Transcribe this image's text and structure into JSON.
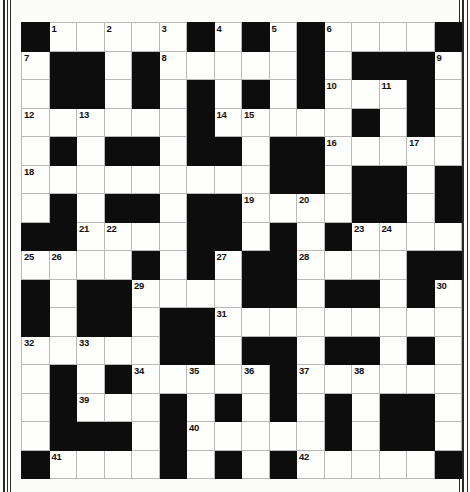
{
  "puzzle": {
    "kind": "crossword-grid",
    "rows": 16,
    "cols": 16,
    "colors": {
      "block": "#0d0d0d",
      "cell": "#fefefd",
      "grid_line": "#b9b9b9",
      "page": "#fbfbf9",
      "number": "#111111",
      "edge_rule": "#2a2a2a"
    },
    "numbers_present": [
      "1",
      "2",
      "3",
      "4",
      "5",
      "6",
      "7",
      "8",
      "9",
      "10",
      "11",
      "12",
      "13",
      "14",
      "15",
      "16",
      "17",
      "18",
      "19",
      "20",
      "21",
      "22",
      "23",
      "24",
      "25",
      "26",
      "27",
      "28",
      "29",
      "30",
      "31",
      "32",
      "33",
      "34",
      "35",
      "36",
      "37",
      "38",
      "39",
      "40",
      "41",
      "42"
    ],
    "cells": [
      [
        {
          "b": true
        },
        {
          "b": false,
          "n": "1"
        },
        {
          "b": false
        },
        {
          "b": false,
          "n": "2"
        },
        {
          "b": false
        },
        {
          "b": false,
          "n": "3"
        },
        {
          "b": true
        },
        {
          "b": false,
          "n": "4"
        },
        {
          "b": true
        },
        {
          "b": false,
          "n": "5"
        },
        {
          "b": true
        },
        {
          "b": false,
          "n": "6"
        },
        {
          "b": false
        },
        {
          "b": false
        },
        {
          "b": false
        },
        {
          "b": true
        }
      ],
      [
        {
          "b": false,
          "n": "7"
        },
        {
          "b": true
        },
        {
          "b": true
        },
        {
          "b": false
        },
        {
          "b": true
        },
        {
          "b": false,
          "n": "8"
        },
        {
          "b": false
        },
        {
          "b": false
        },
        {
          "b": false
        },
        {
          "b": false
        },
        {
          "b": true
        },
        {
          "b": false
        },
        {
          "b": true
        },
        {
          "b": true
        },
        {
          "b": true
        },
        {
          "b": false,
          "n": "9"
        }
      ],
      [
        {
          "b": false
        },
        {
          "b": true
        },
        {
          "b": true
        },
        {
          "b": false
        },
        {
          "b": true
        },
        {
          "b": false
        },
        {
          "b": true
        },
        {
          "b": false
        },
        {
          "b": true
        },
        {
          "b": false
        },
        {
          "b": true
        },
        {
          "b": false,
          "n": "10"
        },
        {
          "b": false
        },
        {
          "b": false,
          "n": "11"
        },
        {
          "b": true
        },
        {
          "b": false
        }
      ],
      [
        {
          "b": false,
          "n": "12"
        },
        {
          "b": false
        },
        {
          "b": false,
          "n": "13"
        },
        {
          "b": false
        },
        {
          "b": false
        },
        {
          "b": false
        },
        {
          "b": true
        },
        {
          "b": false,
          "n": "14"
        },
        {
          "b": false,
          "n": "15"
        },
        {
          "b": false
        },
        {
          "b": false
        },
        {
          "b": false
        },
        {
          "b": true
        },
        {
          "b": false
        },
        {
          "b": true
        },
        {
          "b": false
        }
      ],
      [
        {
          "b": false
        },
        {
          "b": true
        },
        {
          "b": false
        },
        {
          "b": true
        },
        {
          "b": true
        },
        {
          "b": false
        },
        {
          "b": true
        },
        {
          "b": true
        },
        {
          "b": false
        },
        {
          "b": true
        },
        {
          "b": true
        },
        {
          "b": false,
          "n": "16"
        },
        {
          "b": false
        },
        {
          "b": false
        },
        {
          "b": false,
          "n": "17"
        },
        {
          "b": false
        }
      ],
      [
        {
          "b": false,
          "n": "18"
        },
        {
          "b": false
        },
        {
          "b": false
        },
        {
          "b": false
        },
        {
          "b": false
        },
        {
          "b": false
        },
        {
          "b": false
        },
        {
          "b": false
        },
        {
          "b": false
        },
        {
          "b": true
        },
        {
          "b": true
        },
        {
          "b": false
        },
        {
          "b": true
        },
        {
          "b": true
        },
        {
          "b": false
        },
        {
          "b": true
        }
      ],
      [
        {
          "b": false
        },
        {
          "b": true
        },
        {
          "b": false
        },
        {
          "b": true
        },
        {
          "b": true
        },
        {
          "b": false
        },
        {
          "b": true
        },
        {
          "b": true
        },
        {
          "b": false,
          "n": "19"
        },
        {
          "b": false
        },
        {
          "b": false,
          "n": "20"
        },
        {
          "b": false
        },
        {
          "b": true
        },
        {
          "b": true
        },
        {
          "b": false
        },
        {
          "b": true
        }
      ],
      [
        {
          "b": true
        },
        {
          "b": true
        },
        {
          "b": false,
          "n": "21"
        },
        {
          "b": false,
          "n": "22"
        },
        {
          "b": false
        },
        {
          "b": false
        },
        {
          "b": true
        },
        {
          "b": true
        },
        {
          "b": false
        },
        {
          "b": true
        },
        {
          "b": false
        },
        {
          "b": true
        },
        {
          "b": false,
          "n": "23"
        },
        {
          "b": false,
          "n": "24"
        },
        {
          "b": false
        },
        {
          "b": false
        }
      ],
      [
        {
          "b": false,
          "n": "25"
        },
        {
          "b": false,
          "n": "26"
        },
        {
          "b": false
        },
        {
          "b": false
        },
        {
          "b": true
        },
        {
          "b": false
        },
        {
          "b": true
        },
        {
          "b": false,
          "n": "27"
        },
        {
          "b": true
        },
        {
          "b": true
        },
        {
          "b": false,
          "n": "28"
        },
        {
          "b": false
        },
        {
          "b": false
        },
        {
          "b": false
        },
        {
          "b": true
        },
        {
          "b": true
        }
      ],
      [
        {
          "b": true
        },
        {
          "b": false
        },
        {
          "b": true
        },
        {
          "b": true
        },
        {
          "b": false,
          "n": "29"
        },
        {
          "b": false
        },
        {
          "b": false
        },
        {
          "b": false
        },
        {
          "b": true
        },
        {
          "b": true
        },
        {
          "b": false
        },
        {
          "b": true
        },
        {
          "b": true
        },
        {
          "b": false
        },
        {
          "b": true
        },
        {
          "b": false,
          "n": "30"
        }
      ],
      [
        {
          "b": true
        },
        {
          "b": false
        },
        {
          "b": true
        },
        {
          "b": true
        },
        {
          "b": false
        },
        {
          "b": true
        },
        {
          "b": true
        },
        {
          "b": false,
          "n": "31"
        },
        {
          "b": false
        },
        {
          "b": false
        },
        {
          "b": false
        },
        {
          "b": false
        },
        {
          "b": false
        },
        {
          "b": false
        },
        {
          "b": false
        },
        {
          "b": false
        }
      ],
      [
        {
          "b": false,
          "n": "32"
        },
        {
          "b": false
        },
        {
          "b": false,
          "n": "33"
        },
        {
          "b": false
        },
        {
          "b": false
        },
        {
          "b": true
        },
        {
          "b": true
        },
        {
          "b": false
        },
        {
          "b": true
        },
        {
          "b": true
        },
        {
          "b": false
        },
        {
          "b": true
        },
        {
          "b": true
        },
        {
          "b": false
        },
        {
          "b": true
        },
        {
          "b": false
        }
      ],
      [
        {
          "b": false
        },
        {
          "b": true
        },
        {
          "b": false
        },
        {
          "b": true
        },
        {
          "b": false,
          "n": "34"
        },
        {
          "b": false
        },
        {
          "b": false,
          "n": "35"
        },
        {
          "b": false
        },
        {
          "b": false,
          "n": "36"
        },
        {
          "b": true
        },
        {
          "b": false,
          "n": "37"
        },
        {
          "b": false
        },
        {
          "b": false,
          "n": "38"
        },
        {
          "b": false
        },
        {
          "b": false
        },
        {
          "b": false
        }
      ],
      [
        {
          "b": false
        },
        {
          "b": true
        },
        {
          "b": false,
          "n": "39"
        },
        {
          "b": false
        },
        {
          "b": false
        },
        {
          "b": true
        },
        {
          "b": false
        },
        {
          "b": true
        },
        {
          "b": false
        },
        {
          "b": true
        },
        {
          "b": false
        },
        {
          "b": true
        },
        {
          "b": false
        },
        {
          "b": true
        },
        {
          "b": true
        },
        {
          "b": false
        }
      ],
      [
        {
          "b": false
        },
        {
          "b": true
        },
        {
          "b": true
        },
        {
          "b": true
        },
        {
          "b": false
        },
        {
          "b": true
        },
        {
          "b": false,
          "n": "40"
        },
        {
          "b": false
        },
        {
          "b": false
        },
        {
          "b": false
        },
        {
          "b": false
        },
        {
          "b": true
        },
        {
          "b": false
        },
        {
          "b": true
        },
        {
          "b": true
        },
        {
          "b": false
        }
      ],
      [
        {
          "b": true
        },
        {
          "b": false,
          "n": "41"
        },
        {
          "b": false
        },
        {
          "b": false
        },
        {
          "b": false
        },
        {
          "b": true
        },
        {
          "b": false
        },
        {
          "b": true
        },
        {
          "b": false
        },
        {
          "b": true
        },
        {
          "b": false,
          "n": "42"
        },
        {
          "b": false
        },
        {
          "b": false
        },
        {
          "b": false
        },
        {
          "b": false
        },
        {
          "b": true
        }
      ]
    ]
  }
}
